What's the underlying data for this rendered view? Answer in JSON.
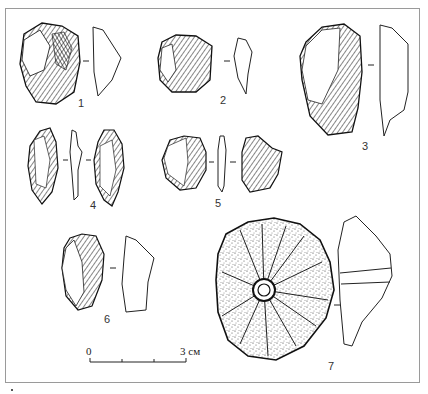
{
  "figure": {
    "type": "archaeological artifact plate",
    "artifacts": [
      {
        "id": "1",
        "label": "1",
        "views": [
          "dorsal",
          "profile"
        ]
      },
      {
        "id": "2",
        "label": "2",
        "views": [
          "dorsal",
          "profile"
        ]
      },
      {
        "id": "3",
        "label": "3",
        "views": [
          "dorsal",
          "profile"
        ]
      },
      {
        "id": "4",
        "label": "4",
        "views": [
          "dorsal",
          "profile",
          "ventral"
        ]
      },
      {
        "id": "5",
        "label": "5",
        "views": [
          "dorsal",
          "profile",
          "ventral"
        ]
      },
      {
        "id": "6",
        "label": "6",
        "views": [
          "dorsal",
          "profile"
        ]
      },
      {
        "id": "7",
        "label": "7",
        "views": [
          "face with perforation",
          "section"
        ]
      }
    ],
    "scale_bar": {
      "start_label": "0",
      "end_label": "3 см",
      "ticks": 4
    }
  },
  "colors": {
    "ink": "#222222",
    "frame": "#9a9a9a",
    "background": "#ffffff"
  }
}
